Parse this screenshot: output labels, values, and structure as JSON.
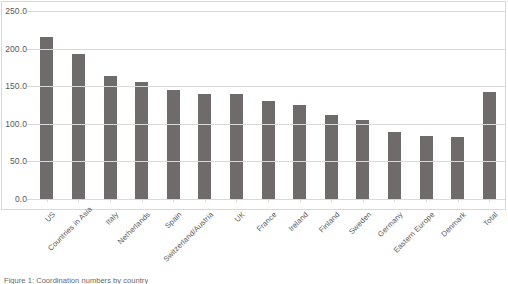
{
  "chart_data": {
    "type": "bar",
    "title": "",
    "xlabel": "",
    "ylabel": "",
    "ylim": [
      0,
      250
    ],
    "ytick_step": 50,
    "ytick_labels": [
      "250.0",
      "200.0",
      "150.0",
      "100.0",
      "50.0",
      "0.0"
    ],
    "ytick_values": [
      250,
      200,
      150,
      100,
      50,
      0
    ],
    "grid": true,
    "legend": false,
    "bar_color": "#6f6b6b",
    "gridline_color": "#d9d9d9",
    "label_color": "#595959",
    "categories": [
      "US",
      "Countries in Asia",
      "Italy",
      "Netherlands",
      "Spain",
      "Switzerland/Austria",
      "UK",
      "France",
      "Ireland",
      "Finland",
      "Sweden",
      "Germany",
      "Eastern Europe",
      "Denmark",
      "Total"
    ],
    "values": [
      215,
      193,
      163,
      155,
      145,
      140,
      139,
      131,
      125,
      112,
      105,
      89,
      84,
      83,
      142
    ]
  },
  "caption": {
    "text": "Figure 1: Coordination numbers by country"
  }
}
